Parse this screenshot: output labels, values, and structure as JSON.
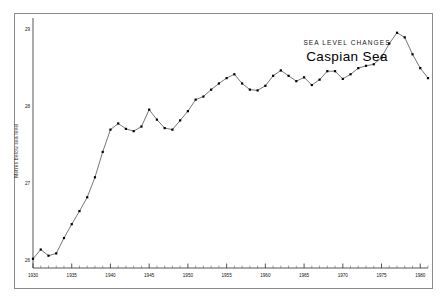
{
  "figure": {
    "background_color": "#ffffff",
    "frame_color": "#8a8a8a",
    "annotation_heading": "SEA  LEVEL  CHANGES",
    "annotation_title": "Caspian  Sea"
  },
  "chart_data": {
    "type": "line",
    "title": "Caspian  Sea",
    "subtitle": "SEA  LEVEL  CHANGES",
    "xlabel": "",
    "ylabel": "Metres below sea level",
    "xlim": [
      1930,
      1981
    ],
    "ylim": [
      29.1,
      25.9
    ],
    "y_inverted": true,
    "grid": false,
    "legend": "none",
    "line_color": "#4a4a4a",
    "marker_color": "#000000",
    "marker_shape": "square",
    "x_major_ticks": [
      1930,
      1935,
      1940,
      1945,
      1950,
      1955,
      1960,
      1965,
      1970,
      1975,
      1980
    ],
    "x_tick_labels": [
      "1930",
      "1935",
      "1940",
      "1945",
      "1950",
      "1955",
      "1960",
      "1965",
      "1970",
      "1975",
      "1980"
    ],
    "x_minor_step": 1,
    "y_major_ticks": [
      26,
      27,
      28,
      29
    ],
    "y_tick_labels": [
      "26",
      "27",
      "28",
      "29"
    ],
    "y_minor_step": 0.1,
    "x": [
      1930,
      1931,
      1932,
      1933,
      1934,
      1935,
      1936,
      1937,
      1938,
      1939,
      1940,
      1941,
      1942,
      1943,
      1944,
      1945,
      1946,
      1947,
      1948,
      1949,
      1950,
      1951,
      1952,
      1953,
      1954,
      1955,
      1956,
      1957,
      1958,
      1959,
      1960,
      1961,
      1962,
      1963,
      1964,
      1965,
      1966,
      1967,
      1968,
      1969,
      1970,
      1971,
      1972,
      1973,
      1974,
      1975,
      1976,
      1977,
      1978,
      1979,
      1980,
      1981
    ],
    "values": [
      26.02,
      26.14,
      26.06,
      26.09,
      26.29,
      26.47,
      26.64,
      26.82,
      27.08,
      27.41,
      27.7,
      27.78,
      27.71,
      27.68,
      27.74,
      27.96,
      27.83,
      27.72,
      27.7,
      27.82,
      27.94,
      28.09,
      28.13,
      28.22,
      28.3,
      28.37,
      28.42,
      28.3,
      28.22,
      28.21,
      28.27,
      28.4,
      28.47,
      28.4,
      28.33,
      28.38,
      28.28,
      28.35,
      28.46,
      28.46,
      28.36,
      28.42,
      28.5,
      28.53,
      28.55,
      28.64,
      28.82,
      28.96,
      28.9,
      28.68,
      28.5,
      28.37
    ],
    "series": [
      {
        "name": "Caspian Sea level",
        "values": [
          26.02,
          26.14,
          26.06,
          26.09,
          26.29,
          26.47,
          26.64,
          26.82,
          27.08,
          27.41,
          27.7,
          27.78,
          27.71,
          27.68,
          27.74,
          27.96,
          27.83,
          27.72,
          27.7,
          27.82,
          27.94,
          28.09,
          28.13,
          28.22,
          28.3,
          28.37,
          28.42,
          28.3,
          28.22,
          28.21,
          28.27,
          28.4,
          28.47,
          28.4,
          28.33,
          28.38,
          28.28,
          28.35,
          28.46,
          28.46,
          28.36,
          28.42,
          28.5,
          28.53,
          28.55,
          28.64,
          28.82,
          28.96,
          28.9,
          28.68,
          28.5,
          28.37
        ]
      }
    ]
  }
}
